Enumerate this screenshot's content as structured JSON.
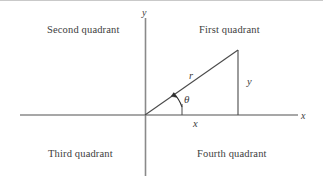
{
  "figure": {
    "title_text": "",
    "quadrants": {
      "second": "Second quadrant",
      "first": "First quadrant",
      "third": "Third quadrant",
      "fourth": "Fourth quadrant"
    },
    "axes": {
      "x_axis_label": "x",
      "y_axis_label": "y"
    },
    "triangle": {
      "hypotenuse_label": "r",
      "angle_label": "θ",
      "horizontal_leg_label": "x",
      "vertical_leg_label": "y"
    },
    "colors": {
      "axis": "#888888",
      "triangle_line": "#3d3d3d",
      "text": "#3d3d3d",
      "background": "#ffffff",
      "top_rule": "#c9c9c9"
    },
    "geometry": {
      "origin_x": 145,
      "origin_y": 115,
      "x_axis_start_x": 20,
      "x_axis_end_x": 298,
      "y_axis_top_y": 18,
      "y_axis_bottom_y": 176,
      "apex_x": 238,
      "apex_y": 50,
      "foot_x": 238,
      "foot_y": 115,
      "angle_degrees": 33
    }
  }
}
